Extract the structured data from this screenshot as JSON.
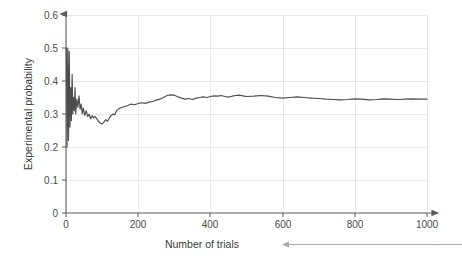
{
  "chart_data": {
    "type": "line",
    "title": "",
    "xlabel": "Number of trials",
    "ylabel": "Experimental probability",
    "xlim": [
      0,
      1000
    ],
    "ylim": [
      0,
      0.6
    ],
    "grid": true,
    "legend": "none",
    "xticks": [
      "0",
      "200",
      "400",
      "600",
      "800",
      "1000"
    ],
    "xtick_values": [
      0,
      200,
      400,
      600,
      800,
      1000
    ],
    "yticks": [
      "0",
      "0.1",
      "0.2",
      "0.3",
      "0.4",
      "0.5",
      "0.6"
    ],
    "ytick_values": [
      0,
      0.1,
      0.2,
      0.3,
      0.4,
      0.5,
      0.6
    ],
    "series": [
      {
        "name": "Experimental probability",
        "color": "#4d4d4d",
        "x": [
          1,
          3,
          5,
          7,
          9,
          11,
          13,
          15,
          17,
          19,
          21,
          23,
          25,
          27,
          30,
          33,
          36,
          39,
          42,
          45,
          48,
          52,
          56,
          60,
          64,
          68,
          72,
          76,
          80,
          85,
          90,
          95,
          100,
          105,
          110,
          115,
          120,
          125,
          130,
          135,
          140,
          145,
          150,
          160,
          170,
          180,
          190,
          200,
          210,
          220,
          230,
          240,
          250,
          260,
          270,
          280,
          290,
          300,
          310,
          320,
          330,
          340,
          350,
          360,
          370,
          380,
          390,
          400,
          410,
          420,
          430,
          440,
          450,
          460,
          470,
          480,
          490,
          500,
          520,
          540,
          560,
          580,
          600,
          620,
          640,
          660,
          680,
          700,
          720,
          740,
          760,
          780,
          800,
          820,
          840,
          860,
          880,
          900,
          920,
          940,
          960,
          980,
          1000
        ],
        "y": [
          0.5,
          0.2,
          0.5,
          0.22,
          0.49,
          0.26,
          0.38,
          0.28,
          0.42,
          0.3,
          0.35,
          0.31,
          0.38,
          0.3,
          0.345,
          0.32,
          0.355,
          0.315,
          0.33,
          0.3,
          0.318,
          0.295,
          0.31,
          0.292,
          0.3,
          0.285,
          0.295,
          0.288,
          0.293,
          0.286,
          0.278,
          0.272,
          0.27,
          0.275,
          0.283,
          0.278,
          0.288,
          0.295,
          0.3,
          0.298,
          0.31,
          0.315,
          0.318,
          0.322,
          0.325,
          0.33,
          0.328,
          0.332,
          0.334,
          0.332,
          0.336,
          0.338,
          0.342,
          0.345,
          0.35,
          0.356,
          0.358,
          0.357,
          0.352,
          0.348,
          0.345,
          0.347,
          0.344,
          0.348,
          0.35,
          0.352,
          0.35,
          0.353,
          0.355,
          0.354,
          0.356,
          0.353,
          0.351,
          0.354,
          0.356,
          0.357,
          0.355,
          0.353,
          0.354,
          0.356,
          0.354,
          0.35,
          0.348,
          0.35,
          0.352,
          0.35,
          0.348,
          0.347,
          0.345,
          0.344,
          0.343,
          0.344,
          0.346,
          0.345,
          0.343,
          0.344,
          0.346,
          0.345,
          0.344,
          0.345,
          0.346,
          0.345,
          0.345
        ]
      }
    ],
    "annotations": [
      {
        "name": "xlabel-callout-arrow",
        "direction": "left",
        "color": "#a8a8a8"
      }
    ]
  }
}
